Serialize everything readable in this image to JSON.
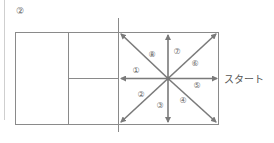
{
  "figure": {
    "label": "②",
    "start_label": "スタート",
    "line_color": "#8a8a8a",
    "arrow_color": "#7a7a7a",
    "directions": [
      {
        "num": "①",
        "dir": "left"
      },
      {
        "num": "②",
        "dir": "down-left"
      },
      {
        "num": "③",
        "dir": "down"
      },
      {
        "num": "④",
        "dir": "down-right"
      },
      {
        "num": "⑤",
        "dir": "right"
      },
      {
        "num": "⑥",
        "dir": "up-right"
      },
      {
        "num": "⑦",
        "dir": "up"
      },
      {
        "num": "⑧",
        "dir": "up-left"
      }
    ]
  }
}
